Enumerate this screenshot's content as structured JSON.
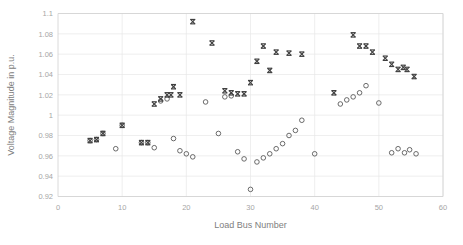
{
  "chart_data": {
    "type": "scatter",
    "title": "",
    "xlabel": "Load Bus Number",
    "ylabel": "Voltage Magnitude in p.u.",
    "xlim": [
      0,
      60
    ],
    "ylim": [
      0.92,
      1.1
    ],
    "xticks": [
      0,
      10,
      20,
      30,
      40,
      50,
      60
    ],
    "yticks": [
      0.92,
      0.94,
      0.96,
      0.98,
      1,
      1.02,
      1.04,
      1.06,
      1.08,
      1.1
    ],
    "xtick_labels": [
      "0",
      "10",
      "20",
      "30",
      "40",
      "50",
      "60"
    ],
    "ytick_labels": [
      "0.92",
      "0.94",
      "0.96",
      "0.98",
      "1",
      "1.02",
      "1.04",
      "1.06",
      "1.08",
      "1.1"
    ],
    "grid": true,
    "grid_axis": "y",
    "legend_position": "none",
    "colors": {
      "marker_filled": "#3f3f3f",
      "marker_open": "#5a5a5a",
      "gridline": "#e8e8e8",
      "axis_text": "#a6a6a6",
      "axis_title": "#808080"
    },
    "series": [
      {
        "name": "series-filled-x",
        "marker": "x-filled",
        "points": [
          [
            5,
            0.975
          ],
          [
            6,
            0.976
          ],
          [
            7,
            0.982
          ],
          [
            10,
            0.99
          ],
          [
            13,
            0.973
          ],
          [
            14,
            0.973
          ],
          [
            15,
            1.011
          ],
          [
            16,
            1.016
          ],
          [
            17,
            1.02
          ],
          [
            17.6,
            1.02
          ],
          [
            18,
            1.028
          ],
          [
            19,
            1.02
          ],
          [
            21,
            1.092
          ],
          [
            24,
            1.071
          ],
          [
            26,
            1.024
          ],
          [
            27,
            1.022
          ],
          [
            28,
            1.021
          ],
          [
            29,
            1.021
          ],
          [
            30,
            1.032
          ],
          [
            31,
            1.053
          ],
          [
            32,
            1.068
          ],
          [
            33,
            1.044
          ],
          [
            34,
            1.062
          ],
          [
            36,
            1.061
          ],
          [
            38,
            1.06
          ],
          [
            43,
            1.022
          ],
          [
            46,
            1.079
          ],
          [
            47,
            1.068
          ],
          [
            48,
            1.068
          ],
          [
            49,
            1.062
          ],
          [
            51,
            1.056
          ],
          [
            52,
            1.05
          ],
          [
            53,
            1.045
          ],
          [
            53.8,
            1.047
          ],
          [
            54.4,
            1.045
          ],
          [
            55.5,
            1.038
          ]
        ]
      },
      {
        "name": "series-open-o",
        "marker": "circle-open",
        "points": [
          [
            5,
            0.975
          ],
          [
            6,
            0.976
          ],
          [
            7,
            0.982
          ],
          [
            9,
            0.967
          ],
          [
            10,
            0.99
          ],
          [
            13,
            0.973
          ],
          [
            14,
            0.973
          ],
          [
            15,
            0.968
          ],
          [
            16,
            1.014
          ],
          [
            17,
            1.016
          ],
          [
            18,
            0.977
          ],
          [
            19,
            0.965
          ],
          [
            20,
            0.962
          ],
          [
            21,
            0.959
          ],
          [
            23,
            1.013
          ],
          [
            25,
            0.982
          ],
          [
            26,
            1.018
          ],
          [
            27,
            1.019
          ],
          [
            28,
            0.964
          ],
          [
            29,
            0.957
          ],
          [
            30,
            0.927
          ],
          [
            31,
            0.954
          ],
          [
            32,
            0.958
          ],
          [
            33,
            0.962
          ],
          [
            34,
            0.967
          ],
          [
            35,
            0.972
          ],
          [
            36,
            0.98
          ],
          [
            37,
            0.985
          ],
          [
            38,
            0.995
          ],
          [
            40,
            0.962
          ],
          [
            44,
            1.011
          ],
          [
            45,
            1.015
          ],
          [
            46,
            1.018
          ],
          [
            47,
            1.022
          ],
          [
            48,
            1.029
          ],
          [
            50,
            1.012
          ],
          [
            52,
            0.963
          ],
          [
            53,
            0.967
          ],
          [
            54,
            0.963
          ],
          [
            54.8,
            0.966
          ],
          [
            55.8,
            0.962
          ]
        ]
      }
    ]
  }
}
